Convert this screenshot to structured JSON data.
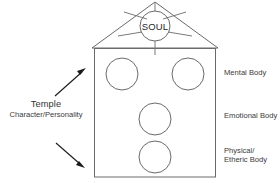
{
  "diagram": {
    "background_color": "#ffffff",
    "line_color": "#6e6e6e",
    "arrow_color": "#1a1a1a",
    "text_color": "#3a3a3a"
  },
  "soul": {
    "label": "SOUL",
    "ray_count": 5
  },
  "temple": {
    "title": "Temple",
    "subtitle": "Character/Personality"
  },
  "bodies": [
    {
      "id": "mental",
      "label": "Mental Body"
    },
    {
      "id": "emotional",
      "label": "Emotional Body"
    },
    {
      "id": "physical",
      "label": "Physical/\nEtheric Body"
    }
  ],
  "arrows": [
    {
      "id": "upper",
      "direction": "up-right"
    },
    {
      "id": "lower",
      "direction": "down-right"
    }
  ]
}
